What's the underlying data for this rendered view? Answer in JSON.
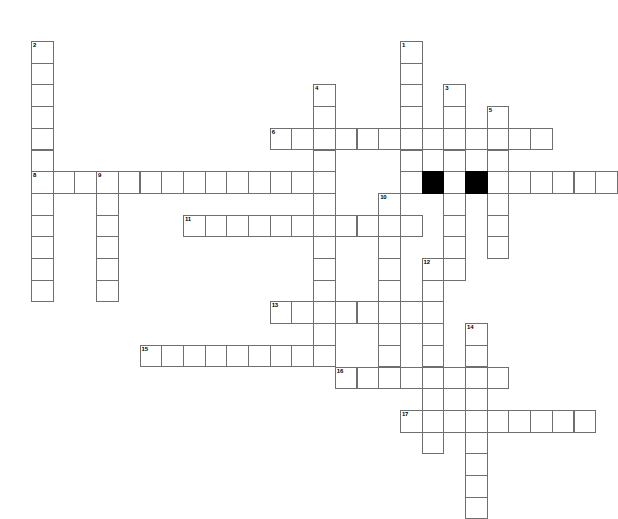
{
  "puzzle": {
    "title": "Crossword Puzzle Grid",
    "grid": {
      "origin_x": 31,
      "origin_y": 41,
      "cell_size": 21.7,
      "rows": 22,
      "cols": 26,
      "cell_border_color": "#6f6f6f",
      "cell_fill_color": "#ffffff",
      "block_fill_color": "#000000",
      "background_color": "#ffffff",
      "number_font_size": 6
    },
    "entries": [
      {
        "number": "1",
        "direction": "down",
        "col": 17,
        "row": 0,
        "length": 7
      },
      {
        "number": "2",
        "direction": "down",
        "col": 0,
        "row": 0,
        "length": 12
      },
      {
        "number": "3",
        "direction": "down",
        "col": 19,
        "row": 2,
        "length": 9
      },
      {
        "number": "4",
        "direction": "down",
        "col": 13,
        "row": 2,
        "length": 13
      },
      {
        "number": "5",
        "direction": "down",
        "col": 21,
        "row": 3,
        "length": 7
      },
      {
        "number": "6",
        "direction": "across",
        "col": 11,
        "row": 4,
        "length": 13
      },
      {
        "number": "7",
        "direction": "across",
        "col": 18,
        "row": 6,
        "length": 9
      },
      {
        "number": "8",
        "direction": "across",
        "col": 0,
        "row": 6,
        "length": 13
      },
      {
        "number": "9",
        "direction": "down",
        "col": 3,
        "row": 6,
        "length": 6
      },
      {
        "number": "10",
        "direction": "down",
        "col": 16,
        "row": 7,
        "length": 9
      },
      {
        "number": "11",
        "direction": "across",
        "col": 7,
        "row": 8,
        "length": 11
      },
      {
        "number": "12",
        "direction": "down",
        "col": 18,
        "row": 10,
        "length": 9
      },
      {
        "number": "13",
        "direction": "across",
        "col": 11,
        "row": 12,
        "length": 7
      },
      {
        "number": "14",
        "direction": "down",
        "col": 20,
        "row": 13,
        "length": 9
      },
      {
        "number": "15",
        "direction": "across",
        "col": 5,
        "row": 14,
        "length": 9
      },
      {
        "number": "16",
        "direction": "across",
        "col": 14,
        "row": 15,
        "length": 8
      },
      {
        "number": "17",
        "direction": "across",
        "col": 17,
        "row": 17,
        "length": 9
      }
    ],
    "blocks": [
      {
        "col": 18,
        "row": 6
      },
      {
        "col": 20,
        "row": 6
      },
      {
        "col": 14,
        "row": 7
      },
      {
        "col": 19,
        "row": 16
      }
    ]
  }
}
